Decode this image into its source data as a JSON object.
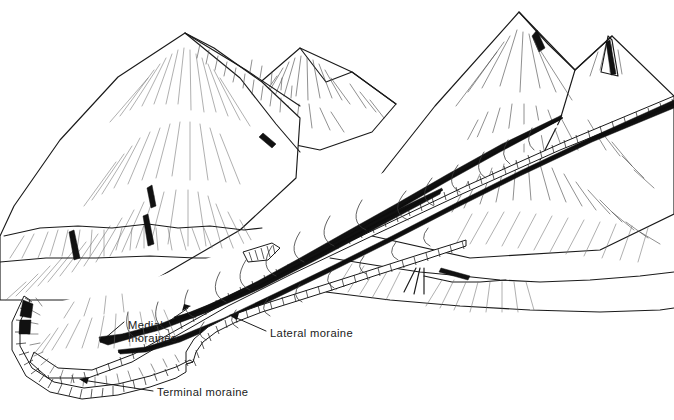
{
  "figure": {
    "kind": "line-drawing",
    "background_color": "#ffffff",
    "ink_color": "#1a1a1a",
    "hatch_color": "#4a4a4a",
    "dark_band_color": "#111111",
    "width": 674,
    "height": 420
  },
  "labels": [
    {
      "id": "medial",
      "line1": "Medial",
      "line2": "moraines",
      "x": 128,
      "y": 329,
      "leader_count": 2
    },
    {
      "id": "lateral",
      "line1": "Lateral moraine",
      "line2": "",
      "x": 270,
      "y": 337,
      "leader_count": 1
    },
    {
      "id": "terminal",
      "line1": "Terminal moraine",
      "line2": "",
      "x": 157,
      "y": 396,
      "leader_count": 1
    }
  ],
  "features": {
    "peaks": [
      {
        "name": "left-main-peak",
        "x": 185,
        "y": 33
      },
      {
        "name": "center-peak",
        "x": 300,
        "y": 48
      },
      {
        "name": "right-main-peak",
        "x": 519,
        "y": 12
      },
      {
        "name": "far-right-peak",
        "x": 612,
        "y": 35
      }
    ],
    "glacier": {
      "name": "valley-glacier",
      "terminus_x": 30,
      "terminus_y": 345
    }
  }
}
